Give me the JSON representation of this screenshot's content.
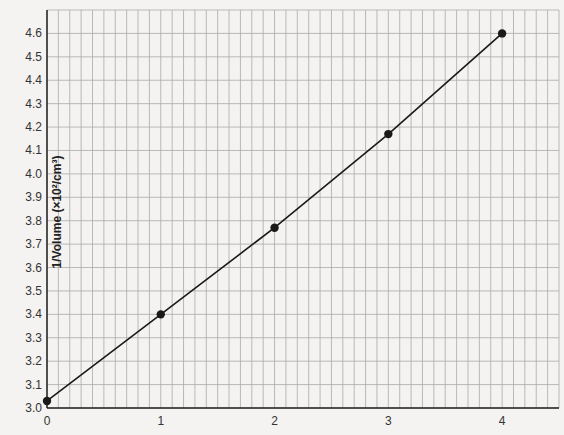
{
  "chart_data": {
    "type": "line",
    "title": "",
    "xlabel": "",
    "ylabel": "1/Volume (×10²/cm³)",
    "x": [
      0,
      1,
      2,
      3,
      4
    ],
    "series": [
      {
        "name": "1/Volume",
        "values": [
          3.03,
          3.4,
          3.77,
          4.17,
          4.6
        ],
        "markers": true
      }
    ],
    "xlim": [
      0,
      4.5
    ],
    "ylim": [
      3.0,
      4.7
    ],
    "xticks": [
      "0",
      "1",
      "2",
      "3",
      "4"
    ],
    "yticks": [
      "3.0",
      "3.1",
      "3.2",
      "3.3",
      "3.4",
      "3.5",
      "3.6",
      "3.7",
      "3.8",
      "3.9",
      "4.0",
      "4.1",
      "4.2",
      "4.3",
      "4.4",
      "4.5",
      "4.6"
    ],
    "grid": true,
    "legend": "none"
  },
  "colors": {
    "grid": "#a9a9a9",
    "axis": "#222222",
    "line": "#1a1a1a",
    "background": "#f4f3f1"
  }
}
